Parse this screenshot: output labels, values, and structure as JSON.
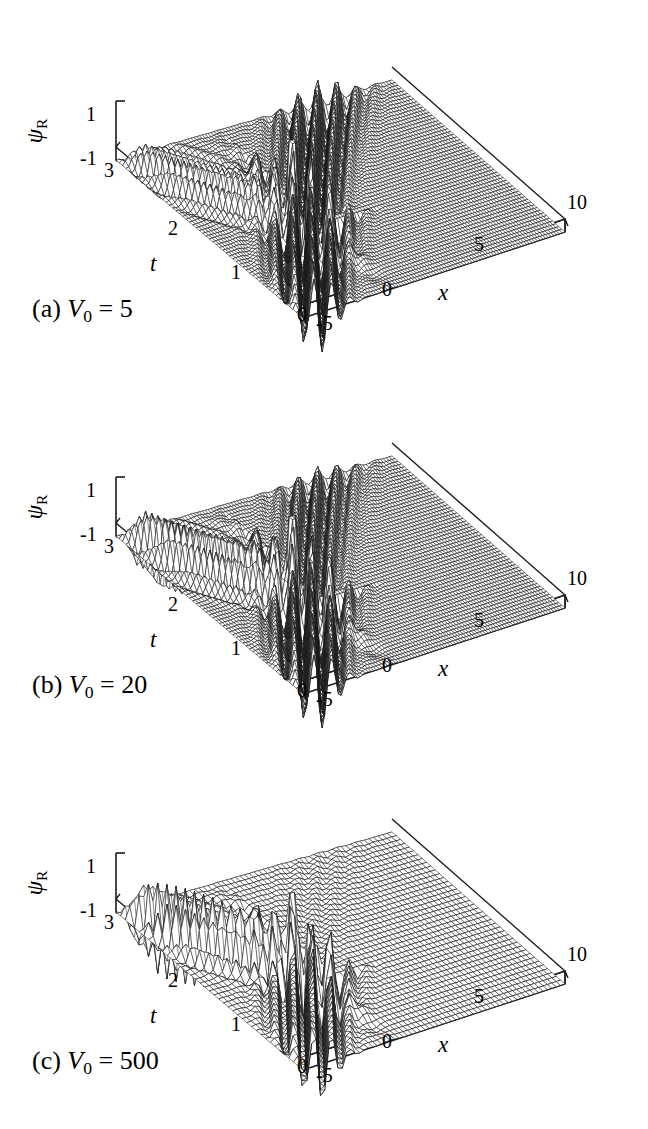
{
  "figure": {
    "type": "3d-surface-wireframe-multipanel",
    "panel_count": 3
  },
  "axes": {
    "z_label": "ψ",
    "z_sub": "R",
    "z_ticks": [
      "1",
      "-1"
    ],
    "z_values": [
      1,
      -1
    ],
    "z_range": [
      -1.4,
      1.4
    ],
    "x_label": "x",
    "x_ticks": [
      "-5",
      "0",
      "5",
      "10"
    ],
    "x_values": [
      -5,
      0,
      5,
      10
    ],
    "x_range": [
      -5,
      10
    ],
    "t_label": "t",
    "t_ticks": [
      "0",
      "1",
      "2",
      "3"
    ],
    "t_values": [
      0,
      1,
      2,
      3
    ],
    "t_range": [
      0,
      3
    ]
  },
  "panels": [
    {
      "id": "a",
      "tag": "(a)",
      "param_name": "V",
      "param_sub": "0",
      "equals": "=",
      "param_value": "5",
      "caption": "(a) V0 = 5",
      "mesh_density": "fine",
      "barrier_strength": 5,
      "z_label": "ψ",
      "z_sub": "R",
      "z_ticks": [
        "1",
        "-1"
      ],
      "x_ticks": [
        "-5",
        "0",
        "5",
        "10"
      ],
      "t_ticks": [
        "0",
        "1",
        "2",
        "3"
      ],
      "x_label": "x",
      "t_label": "t"
    },
    {
      "id": "b",
      "tag": "(b)",
      "param_name": "V",
      "param_sub": "0",
      "equals": "=",
      "param_value": "20",
      "caption": "(b) V0 = 20",
      "mesh_density": "fine",
      "barrier_strength": 20,
      "z_label": "ψ",
      "z_sub": "R",
      "z_ticks": [
        "1",
        "-1"
      ],
      "x_ticks": [
        "-5",
        "0",
        "5",
        "10"
      ],
      "t_ticks": [
        "0",
        "1",
        "2",
        "3"
      ],
      "x_label": "x",
      "t_label": "t"
    },
    {
      "id": "c",
      "tag": "(c)",
      "param_name": "V",
      "param_sub": "0",
      "equals": "=",
      "param_value": "500",
      "caption": "(c) V0 = 500",
      "mesh_density": "coarse",
      "barrier_strength": 500,
      "z_label": "ψ",
      "z_sub": "R",
      "z_ticks": [
        "1",
        "-1"
      ],
      "x_ticks": [
        "-5",
        "0",
        "5",
        "10"
      ],
      "t_ticks": [
        "0",
        "1",
        "2",
        "3"
      ],
      "x_label": "x",
      "t_label": "t"
    }
  ],
  "chart_data": {
    "type": "line",
    "title": "",
    "xlabel": "x",
    "ylabel": "t",
    "zlabel": "psi_R",
    "xlim": [
      -5,
      10
    ],
    "ylim": [
      0,
      3
    ],
    "zlim": [
      -1.4,
      1.4
    ],
    "grid": false,
    "legend": "none",
    "projection": "3d-wireframe-mesh",
    "series": [
      {
        "name": "(a) V0 = 5",
        "barrier": 5,
        "nx": 96,
        "nt": 56,
        "k": 6.0,
        "reflection_amplitude": 0.45,
        "transmission_amplitude": 0.62,
        "peak_z": 1.0,
        "trough_z": -1.0
      },
      {
        "name": "(b) V0 = 20",
        "barrier": 20,
        "nx": 96,
        "nt": 56,
        "k": 6.0,
        "reflection_amplitude": 0.72,
        "transmission_amplitude": 0.4,
        "peak_z": 1.0,
        "trough_z": -1.0
      },
      {
        "name": "(c) V0 = 500",
        "barrier": 500,
        "nx": 60,
        "nt": 40,
        "k": 6.0,
        "reflection_amplitude": 1.0,
        "transmission_amplitude": 0.06,
        "peak_z": 1.0,
        "trough_z": -1.0
      }
    ]
  },
  "style": {
    "line_color": "#1a1a1a",
    "background": "#ffffff",
    "text_color": "#000000"
  }
}
